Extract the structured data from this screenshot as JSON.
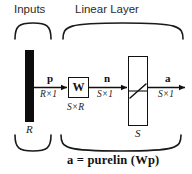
{
  "diagram": {
    "title_groups": {
      "inputs": "Inputs",
      "layer": "Linear Layer"
    },
    "input_block": {
      "dimension": "R",
      "icon": "input-vector-bar"
    },
    "signals": {
      "p": {
        "name": "p",
        "dimension": "R×1"
      },
      "n": {
        "name": "n",
        "dimension": "S×1"
      },
      "a": {
        "name": "a",
        "dimension": "S×1"
      }
    },
    "weight_block": {
      "symbol": "W",
      "dimension": "S×R"
    },
    "transfer_block": {
      "symbol": "purelin-linear-glyph",
      "dimension": "S"
    },
    "equation": "a = purelin (Wp)",
    "colors": {
      "ink": "#111111",
      "bar_fill": "#0d0d0d",
      "background": "#ffffff",
      "sans_text": "#2b2b2b"
    }
  }
}
